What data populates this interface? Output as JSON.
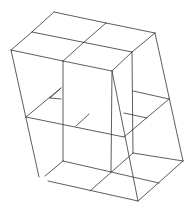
{
  "diagram": {
    "type": "wireframe-line-drawing",
    "stroke_color": "#333333",
    "background_color": "#ffffff",
    "width": 192,
    "height": 207,
    "segments": [
      {
        "name": "top-back-edge-a",
        "x1": 54,
        "y1": 12,
        "x2": 106,
        "y2": 23
      },
      {
        "name": "top-back-edge-b",
        "x1": 106,
        "y1": 23,
        "x2": 155,
        "y2": 33
      },
      {
        "name": "top-left-edge-a",
        "x1": 54,
        "y1": 12,
        "x2": 32,
        "y2": 32
      },
      {
        "name": "top-left-edge-b",
        "x1": 32,
        "y1": 32,
        "x2": 11,
        "y2": 50
      },
      {
        "name": "top-mid-row",
        "x1": 32,
        "y1": 32,
        "x2": 132,
        "y2": 52
      },
      {
        "name": "top-mid-col-a",
        "x1": 106,
        "y1": 23,
        "x2": 83,
        "y2": 43
      },
      {
        "name": "top-mid-col-b",
        "x1": 83,
        "y1": 43,
        "x2": 63,
        "y2": 61
      },
      {
        "name": "top-front-edge-a",
        "x1": 11,
        "y1": 50,
        "x2": 63,
        "y2": 61
      },
      {
        "name": "top-front-edge-b",
        "x1": 63,
        "y1": 61,
        "x2": 112,
        "y2": 71
      },
      {
        "name": "top-right-edge-a",
        "x1": 155,
        "y1": 33,
        "x2": 132,
        "y2": 52
      },
      {
        "name": "top-right-edge-b",
        "x1": 132,
        "y1": 52,
        "x2": 112,
        "y2": 71
      },
      {
        "name": "left-vertical-edge",
        "x1": 11,
        "y1": 50,
        "x2": 39,
        "y2": 177
      },
      {
        "name": "inner-vertical-left",
        "x1": 63,
        "y1": 61,
        "x2": 63,
        "y2": 161
      },
      {
        "name": "inner-vertical-front",
        "x1": 112,
        "y1": 71,
        "x2": 111,
        "y2": 172
      },
      {
        "name": "inner-vertical-right",
        "x1": 132,
        "y1": 52,
        "x2": 133,
        "y2": 153
      },
      {
        "name": "front-diagonal-edge",
        "x1": 112,
        "y1": 71,
        "x2": 138,
        "y2": 201
      },
      {
        "name": "right-vertical-edge",
        "x1": 155,
        "y1": 33,
        "x2": 183,
        "y2": 161
      },
      {
        "name": "mid-left-stub",
        "x1": 50,
        "y1": 98,
        "x2": 61,
        "y2": 88
      },
      {
        "name": "mid-left-stub-h",
        "x1": 50,
        "y1": 98,
        "x2": 61,
        "y2": 99
      },
      {
        "name": "mid-left-edge",
        "x1": 61,
        "y1": 88,
        "x2": 26,
        "y2": 117
      },
      {
        "name": "mid-front-edge",
        "x1": 26,
        "y1": 117,
        "x2": 124,
        "y2": 137
      },
      {
        "name": "mid-center-stub",
        "x1": 76,
        "y1": 126,
        "x2": 89,
        "y2": 114
      },
      {
        "name": "mid-right-edge",
        "x1": 124,
        "y1": 137,
        "x2": 169,
        "y2": 99
      },
      {
        "name": "mid-back-right",
        "x1": 133,
        "y1": 91,
        "x2": 169,
        "y2": 99
      },
      {
        "name": "mid-right-stub",
        "x1": 124,
        "y1": 113,
        "x2": 147,
        "y2": 118
      },
      {
        "name": "bottom-back-left",
        "x1": 63,
        "y1": 161,
        "x2": 111,
        "y2": 172
      },
      {
        "name": "bottom-back-right",
        "x1": 133,
        "y1": 153,
        "x2": 183,
        "y2": 161
      },
      {
        "name": "bottom-left-diag",
        "x1": 63,
        "y1": 161,
        "x2": 45,
        "y2": 176
      },
      {
        "name": "bottom-mid-row",
        "x1": 111,
        "y1": 172,
        "x2": 159,
        "y2": 183
      },
      {
        "name": "bottom-center-diag",
        "x1": 133,
        "y1": 153,
        "x2": 90,
        "y2": 191
      },
      {
        "name": "bottom-right-edge",
        "x1": 183,
        "y1": 161,
        "x2": 138,
        "y2": 201
      },
      {
        "name": "bottom-front-edge",
        "x1": 48,
        "y1": 181,
        "x2": 138,
        "y2": 201
      }
    ]
  }
}
